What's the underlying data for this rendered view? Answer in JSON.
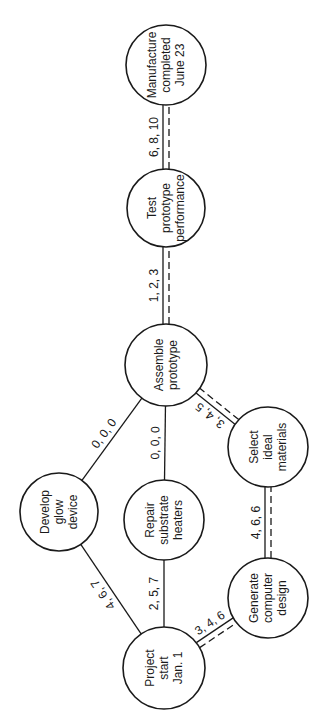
{
  "diagram": {
    "type": "pert-network",
    "orientation": "rotated-90-ccw",
    "colors": {
      "stroke": "#1a1a1a",
      "background": "#ffffff"
    },
    "nodes": [
      {
        "id": "project_start",
        "lines": [
          "Project",
          "start",
          "Jan. 1"
        ],
        "cx": 164,
        "cy": 668,
        "r": 41
      },
      {
        "id": "develop_glow",
        "lines": [
          "Develop",
          "glow",
          "device"
        ],
        "cx": 59,
        "cy": 512,
        "r": 39
      },
      {
        "id": "repair_heaters",
        "lines": [
          "Repair",
          "substrate",
          "heaters"
        ],
        "cx": 164,
        "cy": 520,
        "r": 40
      },
      {
        "id": "generate_design",
        "lines": [
          "Generate",
          "computer",
          "design"
        ],
        "cx": 268,
        "cy": 598,
        "r": 40
      },
      {
        "id": "select_materials",
        "lines": [
          "Select",
          "ideal",
          "materials"
        ],
        "cx": 268,
        "cy": 447,
        "r": 40
      },
      {
        "id": "assemble_prototype",
        "lines": [
          "Assemble",
          "prototype"
        ],
        "cx": 166,
        "cy": 365,
        "r": 41
      },
      {
        "id": "test_prototype",
        "lines": [
          "Test",
          "prototype",
          "performance"
        ],
        "cx": 166,
        "cy": 208,
        "r": 39
      },
      {
        "id": "manufacture_completed",
        "lines": [
          "Manufacture",
          "completed",
          "June 23"
        ],
        "cx": 166,
        "cy": 65,
        "r": 40
      }
    ],
    "edges": [
      {
        "from": "project_start",
        "to": "develop_glow",
        "label": "4, 6, 7",
        "critical": false
      },
      {
        "from": "project_start",
        "to": "repair_heaters",
        "label": "2, 5, 7",
        "critical": false
      },
      {
        "from": "project_start",
        "to": "generate_design",
        "label": "3, 4, 6",
        "critical": true
      },
      {
        "from": "develop_glow",
        "to": "assemble_prototype",
        "label": "0, 0, 0",
        "critical": false
      },
      {
        "from": "repair_heaters",
        "to": "assemble_prototype",
        "label": "0, 0, 0",
        "critical": false
      },
      {
        "from": "generate_design",
        "to": "select_materials",
        "label": "4, 6, 6",
        "critical": true
      },
      {
        "from": "select_materials",
        "to": "assemble_prototype",
        "label": "3, 4, 5",
        "critical": true
      },
      {
        "from": "assemble_prototype",
        "to": "test_prototype",
        "label": "1, 2, 3",
        "critical": true
      },
      {
        "from": "test_prototype",
        "to": "manufacture_completed",
        "label": "6, 8, 10",
        "critical": true
      }
    ]
  }
}
